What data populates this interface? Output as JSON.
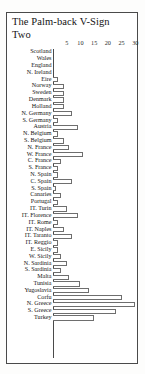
{
  "chart": {
    "title_line1": "The Palm-back V-Sign",
    "title_line2": "Two"
  },
  "chart_data": {
    "type": "bar",
    "orientation": "horizontal",
    "title": "The Palm-back V-Sign Two",
    "xlabel": "",
    "ylabel": "",
    "xlim": [
      0,
      32
    ],
    "grid": false,
    "legend": null,
    "axis_ticks": [
      5,
      10,
      15,
      20,
      25,
      30
    ],
    "categories": [
      "Scotland",
      "Wales",
      "England",
      "N. Ireland",
      "Eire",
      "Norway",
      "Sweden",
      "Denmark",
      "Holland",
      "N. Germany",
      "S. Germany",
      "Austria",
      "N. Belgium",
      "S. Belgium",
      "N. France",
      "W. France",
      "C. France",
      "S. France",
      "N. Spain",
      "C. Spain",
      "S. Spain",
      "Canaries",
      "Portugal",
      "IT. Turin",
      "IT. Florence",
      "IT. Rome",
      "IT. Naples",
      "IT. Taranto",
      "IT. Reggio",
      "E. Sicily",
      "W. Sicily",
      "N. Sardinia",
      "S. Sardinia",
      "Malta",
      "Tunisia",
      "Yugoslavia",
      "Corfu",
      "N. Greece",
      "S. Greece",
      "Turkey"
    ],
    "values": [
      0,
      0,
      0,
      0,
      2,
      4,
      4,
      4,
      4,
      7,
      2,
      9,
      2,
      4,
      6,
      11,
      3,
      2,
      2,
      7,
      1,
      3,
      2,
      5,
      9,
      2,
      4,
      7,
      2,
      2,
      3,
      5,
      3,
      6,
      10,
      13,
      25,
      30,
      23,
      15
    ]
  }
}
